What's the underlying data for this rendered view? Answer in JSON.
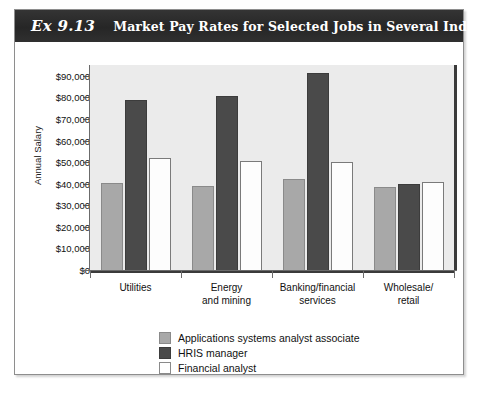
{
  "exhibit": {
    "number": "Ex 9.13",
    "title": "Market Pay Rates for Selected Jobs in Several Industries"
  },
  "chart_data": {
    "type": "bar",
    "title": "Market Pay Rates for Selected Jobs in Several Industries",
    "xlabel": "",
    "ylabel": "Annual Salary",
    "ylim": [
      0,
      95000
    ],
    "ytick_values": [
      0,
      10000,
      20000,
      30000,
      40000,
      50000,
      60000,
      70000,
      80000,
      90000
    ],
    "ytick_labels": [
      "$0",
      "$10,000",
      "$20,000",
      "$30,000",
      "$40,000",
      "$50,000",
      "$60,000",
      "$70,000",
      "$80,000",
      "$90,000"
    ],
    "categories": [
      "Utilities",
      "Energy and mining",
      "Banking/financial services",
      "Wholesale/retail"
    ],
    "category_labels": [
      [
        "Utilities"
      ],
      [
        "Energy",
        "and mining"
      ],
      [
        "Banking/financial",
        "services"
      ],
      [
        "Wholesale/",
        "retail"
      ]
    ],
    "series": [
      {
        "name": "Applications systems analyst associate",
        "color": "#a8a8a8",
        "values": [
          40500,
          39000,
          42000,
          38500
        ]
      },
      {
        "name": "HRIS manager",
        "color": "#4a4a4a",
        "values": [
          79000,
          80500,
          91500,
          40000
        ]
      },
      {
        "name": "Financial analyst",
        "color": "#fdfdfd",
        "values": [
          52000,
          50500,
          50000,
          41000
        ]
      }
    ],
    "grid": false,
    "legend_position": "bottom-center"
  }
}
